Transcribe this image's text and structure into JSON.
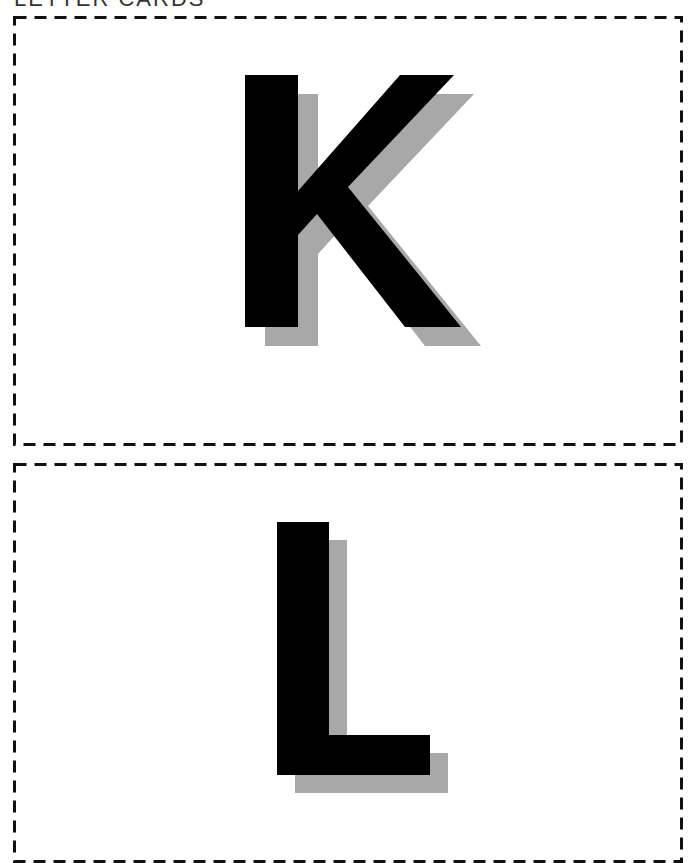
{
  "page": {
    "heading": "LETTER CARDS"
  },
  "cards": [
    {
      "letter": "K",
      "border_style": "dashed",
      "border_color": "#111111",
      "fill_color": "#000000",
      "shadow_color": "#a8a8a8"
    },
    {
      "letter": "L",
      "border_style": "dashed",
      "border_color": "#111111",
      "fill_color": "#000000",
      "shadow_color": "#a8a8a8"
    }
  ]
}
